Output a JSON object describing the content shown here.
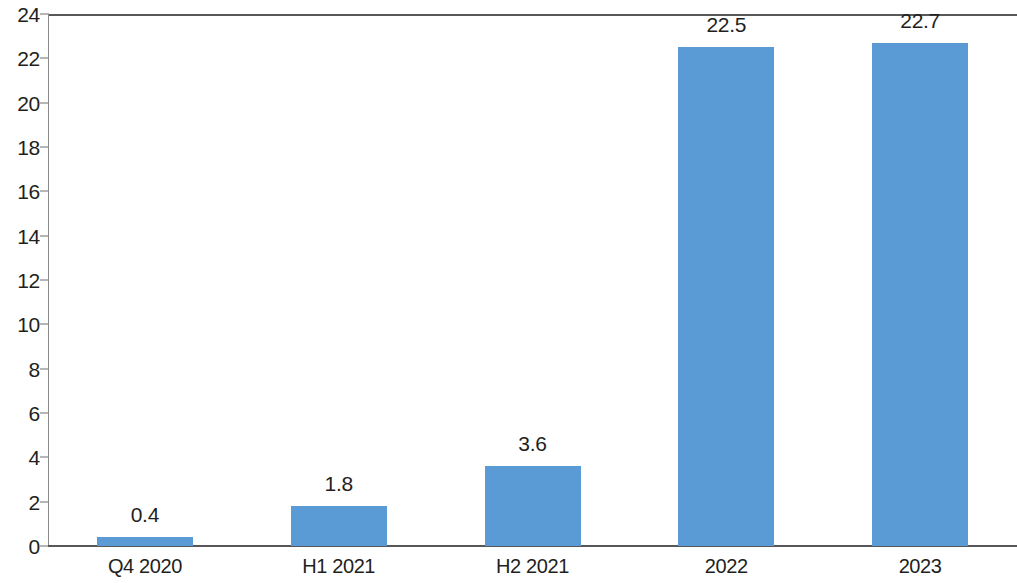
{
  "chart_data": {
    "type": "bar",
    "title": "",
    "subtitle": "",
    "xlabel": "",
    "ylabel": "",
    "categories": [
      "Q4 2020",
      "H1 2021",
      "H2 2021",
      "2022",
      "2023"
    ],
    "values": [
      0.4,
      1.8,
      3.6,
      22.5,
      22.7
    ],
    "value_labels": [
      "0.4",
      "1.8",
      "3.6",
      "22.5",
      "22.7"
    ],
    "ylim": [
      0,
      24
    ],
    "ytick_step": 2,
    "yticks": [
      0,
      2,
      4,
      6,
      8,
      10,
      12,
      14,
      16,
      18,
      20,
      22,
      24
    ],
    "ytick_labels": [
      "0",
      "2",
      "4",
      "6",
      "8",
      "10",
      "12",
      "14",
      "16",
      "18",
      "20",
      "22",
      "24"
    ],
    "grid": false,
    "legend": null,
    "legend_position": "none",
    "series": [
      {
        "name": "",
        "values": [
          0.4,
          1.8,
          3.6,
          22.5,
          22.7
        ],
        "color": "#5b9bd5"
      }
    ],
    "colors": {
      "bar": "#5b9bd5",
      "axis": "#58585a",
      "text": "#231f20",
      "background": "#ffffff"
    },
    "annotations": []
  }
}
